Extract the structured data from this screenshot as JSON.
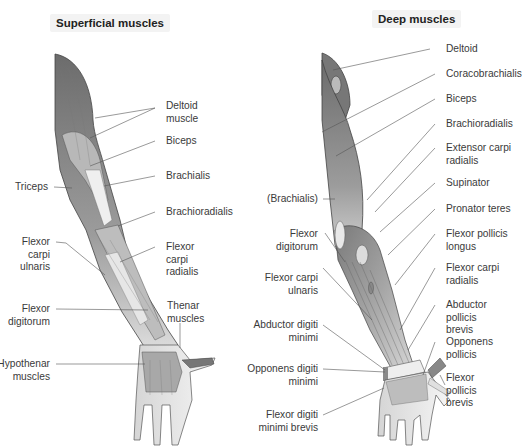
{
  "diagram": {
    "type": "anatomical-illustration"
  },
  "panels": [
    {
      "title": "Superficial muscles",
      "labels": [
        {
          "text": "Deltoid\nmuscle",
          "side": "right"
        },
        {
          "text": "Biceps",
          "side": "right"
        },
        {
          "text": "Brachialis",
          "side": "right"
        },
        {
          "text": "Brachioradialis",
          "side": "right"
        },
        {
          "text": "Flexor\ncarpi\nradialis",
          "side": "right"
        },
        {
          "text": "Thenar\nmuscles",
          "side": "right"
        },
        {
          "text": "Triceps",
          "side": "left"
        },
        {
          "text": "Flexor\ncarpi\nulnaris",
          "side": "left"
        },
        {
          "text": "Flexor\ndigitorum",
          "side": "left"
        },
        {
          "text": "Hypothenar\nmuscles",
          "side": "left"
        }
      ]
    },
    {
      "title": "Deep muscles",
      "labels": [
        {
          "text": "Deltoid",
          "side": "right"
        },
        {
          "text": "Coracobrachialis",
          "side": "right"
        },
        {
          "text": "Biceps",
          "side": "right"
        },
        {
          "text": "Brachioradialis",
          "side": "right"
        },
        {
          "text": "Extensor carpi\nradialis",
          "side": "right"
        },
        {
          "text": "Supinator",
          "side": "right"
        },
        {
          "text": "Pronator teres",
          "side": "right"
        },
        {
          "text": "Flexor pollicis\nlongus",
          "side": "right"
        },
        {
          "text": "Flexor carpi\nradialis",
          "side": "right"
        },
        {
          "text": "Abductor pollicis\nbrevis",
          "side": "right"
        },
        {
          "text": "Opponens\npollicis",
          "side": "right"
        },
        {
          "text": "Flexor\npollicis\nbrevis",
          "side": "right"
        },
        {
          "text": "(Brachialis)",
          "side": "left"
        },
        {
          "text": "Flexor\ndigitorum",
          "side": "left"
        },
        {
          "text": "Flexor carpi\nulnaris",
          "side": "left"
        },
        {
          "text": "Abductor digiti\nminimi",
          "side": "left"
        },
        {
          "text": "Opponens digiti\nminimi",
          "side": "left"
        },
        {
          "text": "Flexor digiti\nminimi brevis",
          "side": "left"
        }
      ]
    }
  ],
  "colors": {
    "muscle_dark": "#6e6e6e",
    "muscle_mid": "#9a9a9a",
    "muscle_light": "#d6d6d6",
    "tendon": "#f2f2f2",
    "leader_line": "#555555",
    "title_bg": "#f3f3f3"
  }
}
